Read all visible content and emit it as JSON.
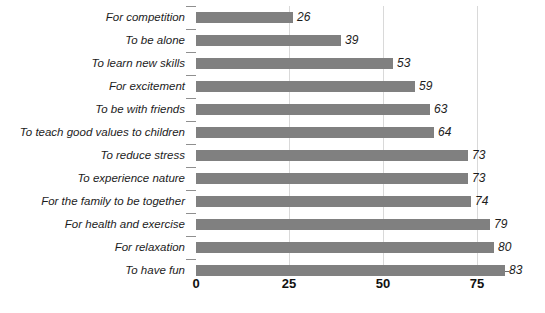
{
  "chart_data": {
    "type": "bar",
    "orientation": "horizontal",
    "title": "",
    "subtitle": "",
    "xlabel": "",
    "ylabel": "",
    "xlim": [
      0,
      93
    ],
    "xticks": [
      0,
      25,
      50,
      75
    ],
    "xtick_labels": [
      "0",
      "25",
      "50",
      "75"
    ],
    "grid": "vertical",
    "legend": "none",
    "bar_color": "#808080",
    "categories": [
      "For competition",
      "To be alone",
      "To learn new skills",
      "For excitement",
      "To be with friends",
      "To teach good values to children",
      "To reduce stress",
      "To experience nature",
      "For the family to be together",
      "For health and exercise",
      "For relaxation",
      "To have fun"
    ],
    "values": [
      26,
      39,
      53,
      59,
      63,
      64,
      73,
      73,
      74,
      79,
      80,
      83
    ],
    "value_labels": [
      "26",
      "39",
      "53",
      "59",
      "63",
      "64",
      "73",
      "73",
      "74",
      "79",
      "80",
      "83"
    ]
  }
}
